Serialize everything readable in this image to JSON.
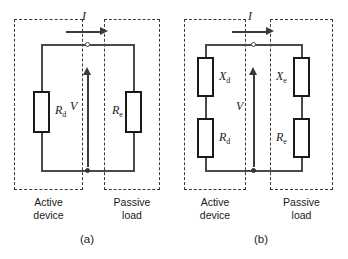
{
  "figure": {
    "panels": [
      {
        "caption": "(a)",
        "current_label": "I",
        "voltage_label": "V",
        "left_box_label_line1": "Active",
        "left_box_label_line2": "device",
        "right_box_label_line1": "Passive",
        "right_box_label_line2": "load",
        "components": [
          {
            "symbol": "R",
            "subscript": "d",
            "side": "left"
          },
          {
            "symbol": "R",
            "subscript": "e",
            "side": "right"
          }
        ]
      },
      {
        "caption": "(b)",
        "current_label": "I",
        "voltage_label": "V",
        "left_box_label_line1": "Active",
        "left_box_label_line2": "device",
        "right_box_label_line1": "Passive",
        "right_box_label_line2": "load",
        "components": [
          {
            "symbol": "X",
            "subscript": "d",
            "side": "left"
          },
          {
            "symbol": "R",
            "subscript": "d",
            "side": "left"
          },
          {
            "symbol": "X",
            "subscript": "e",
            "side": "right"
          },
          {
            "symbol": "R",
            "subscript": "e",
            "side": "right"
          }
        ]
      }
    ],
    "colors": {
      "wire": "#4a4a4a",
      "component_outline": "#1a1a1a",
      "dashed_box": "#3a3a3a",
      "text": "#1a1a1a",
      "background": "#ffffff"
    }
  }
}
